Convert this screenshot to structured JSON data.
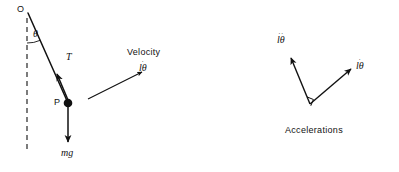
{
  "figure": {
    "width": 399,
    "height": 172,
    "background": "#ffffff",
    "stroke_color": "#111111",
    "text_color": "#111111"
  },
  "left_diagram": {
    "title": "pendulum free body diagram",
    "pivot_label": "O",
    "angle_label": "θ",
    "tension_label": "T",
    "mass_point_label": "P",
    "weight_label": "mg",
    "velocity_caption": "Velocity",
    "velocity_vector_symbol": "lθ",
    "velocity_vector_dots": "·",
    "geometry": {
      "pivot": [
        28,
        13
      ],
      "mass": [
        68,
        103
      ],
      "dashed_vertical_top": [
        27,
        18
      ],
      "dashed_vertical_bottom": [
        27,
        153
      ],
      "tension_arrow_tip": [
        57,
        76
      ],
      "weight_arrow_tip": [
        68,
        143
      ],
      "velocity_arrow_start": [
        88,
        99
      ],
      "velocity_arrow_tip": [
        143,
        72
      ],
      "angle_arc_radius": 30
    }
  },
  "right_diagram": {
    "title": "acceleration components diagram",
    "caption": "Accelerations",
    "tangential_symbol": "lθ",
    "tangential_dots": "··",
    "radial_symbol": "lθ",
    "radial_dots": "·",
    "geometry": {
      "vertex": [
        310,
        104
      ],
      "tangential_tip": [
        290,
        57
      ],
      "radial_tip": [
        352,
        68
      ],
      "right_angle_marker_size": 7
    }
  }
}
